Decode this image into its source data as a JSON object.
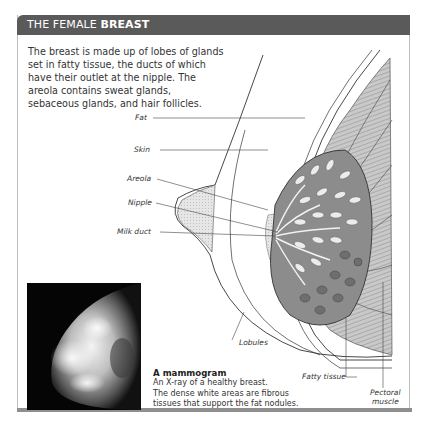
{
  "header": {
    "title_regular": "THE FEMALE ",
    "title_bold": "BREAST",
    "background_color": "#5a5a5a",
    "text_color": "#ffffff"
  },
  "intro": {
    "text": "The breast is made up of lobes of glands set in fatty tissue, the ducts of which have their outlet at the nipple. The areola contains sweat glands, sebaceous glands, and hair follicles."
  },
  "diagram": {
    "labels": [
      {
        "id": "fat",
        "text": "Fat"
      },
      {
        "id": "skin",
        "text": "Skin"
      },
      {
        "id": "areola",
        "text": "Areola"
      },
      {
        "id": "nipple",
        "text": "Nipple"
      },
      {
        "id": "milk-duct",
        "text": "Milk duct"
      },
      {
        "id": "lobules",
        "text": "Lobules"
      },
      {
        "id": "fatty-tissue",
        "text": "Fatty tissue"
      },
      {
        "id": "pectoral-muscle-1",
        "text": "Pectoral"
      },
      {
        "id": "pectoral-muscle-2",
        "text": "muscle"
      }
    ]
  },
  "mammogram": {
    "title": "A mammogram",
    "line1": "An X-ray of a healthy breast.",
    "line2": "The dense white areas are fibrous",
    "line3": "tissues that support the fat nodules."
  }
}
